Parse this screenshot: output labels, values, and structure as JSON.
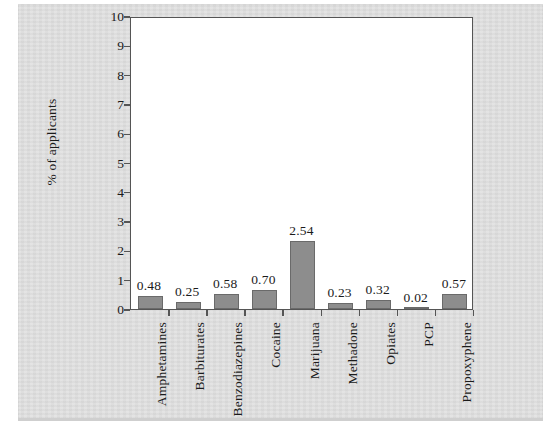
{
  "chart_data": {
    "type": "bar",
    "title": "",
    "xlabel": "",
    "ylabel": "% of applicants",
    "ylim": [
      0,
      10
    ],
    "ytick_labels": [
      "10",
      "9",
      "8",
      "7",
      "6",
      "5",
      "4",
      "3",
      "2",
      "1",
      "0"
    ],
    "yticks": [
      10,
      9,
      8,
      7,
      6,
      5,
      4,
      3,
      2,
      1,
      0
    ],
    "grid": false,
    "legend": false,
    "categories": [
      "Amphetamines",
      "Barbiturates",
      "Benzodiazepines",
      "Cocaine",
      "Marijuana",
      "Methadone",
      "Opiates",
      "PCP",
      "Propoxyphene"
    ],
    "values": [
      0.48,
      0.25,
      0.58,
      0.7,
      2.54,
      0.23,
      0.32,
      0.02,
      0.57
    ],
    "value_labels": [
      "0.48",
      "0.25",
      "0.58",
      "0.70",
      "2.54",
      "0.23",
      "0.32",
      "0.02",
      "0.57"
    ],
    "bar_color": "#8d8d8d",
    "bar_edge_color": "#6a6a6a",
    "axis_color": "#555555",
    "plot_background": "#ffffff",
    "page_background": "#dcdcdc"
  }
}
